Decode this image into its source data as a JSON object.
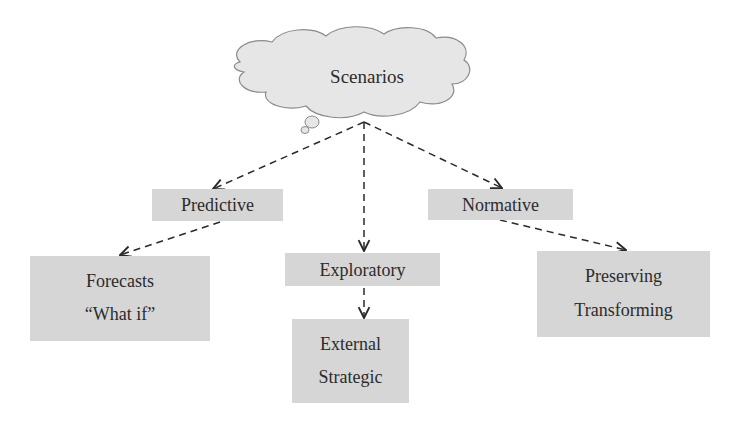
{
  "diagram": {
    "type": "hierarchy",
    "root": {
      "label": "Scenarios",
      "shape": "cloud"
    },
    "categories": [
      {
        "label": "Predictive",
        "children": [
          {
            "lines": [
              "Forecasts",
              "“What if”"
            ]
          }
        ]
      },
      {
        "label": "Exploratory",
        "children": [
          {
            "lines": [
              "External",
              "Strategic"
            ]
          }
        ]
      },
      {
        "label": "Normative",
        "children": [
          {
            "lines": [
              "Preserving",
              "Transforming"
            ]
          }
        ]
      }
    ],
    "edges": [
      {
        "from": "Scenarios",
        "to": "Predictive",
        "style": "dashed-arrow"
      },
      {
        "from": "Scenarios",
        "to": "Exploratory",
        "style": "dashed-arrow"
      },
      {
        "from": "Scenarios",
        "to": "Normative",
        "style": "dashed-arrow"
      },
      {
        "from": "Predictive",
        "to": "Forecasts / What if",
        "style": "dashed-arrow"
      },
      {
        "from": "Exploratory",
        "to": "External / Strategic",
        "style": "dashed-arrow"
      },
      {
        "from": "Normative",
        "to": "Preserving / Transforming",
        "style": "dashed-arrow"
      }
    ],
    "colors": {
      "box_fill": "#d6d6d6",
      "cloud_fill": "#e6e6e6",
      "line": "#2a2a2a",
      "text": "#2c2c2c"
    }
  }
}
